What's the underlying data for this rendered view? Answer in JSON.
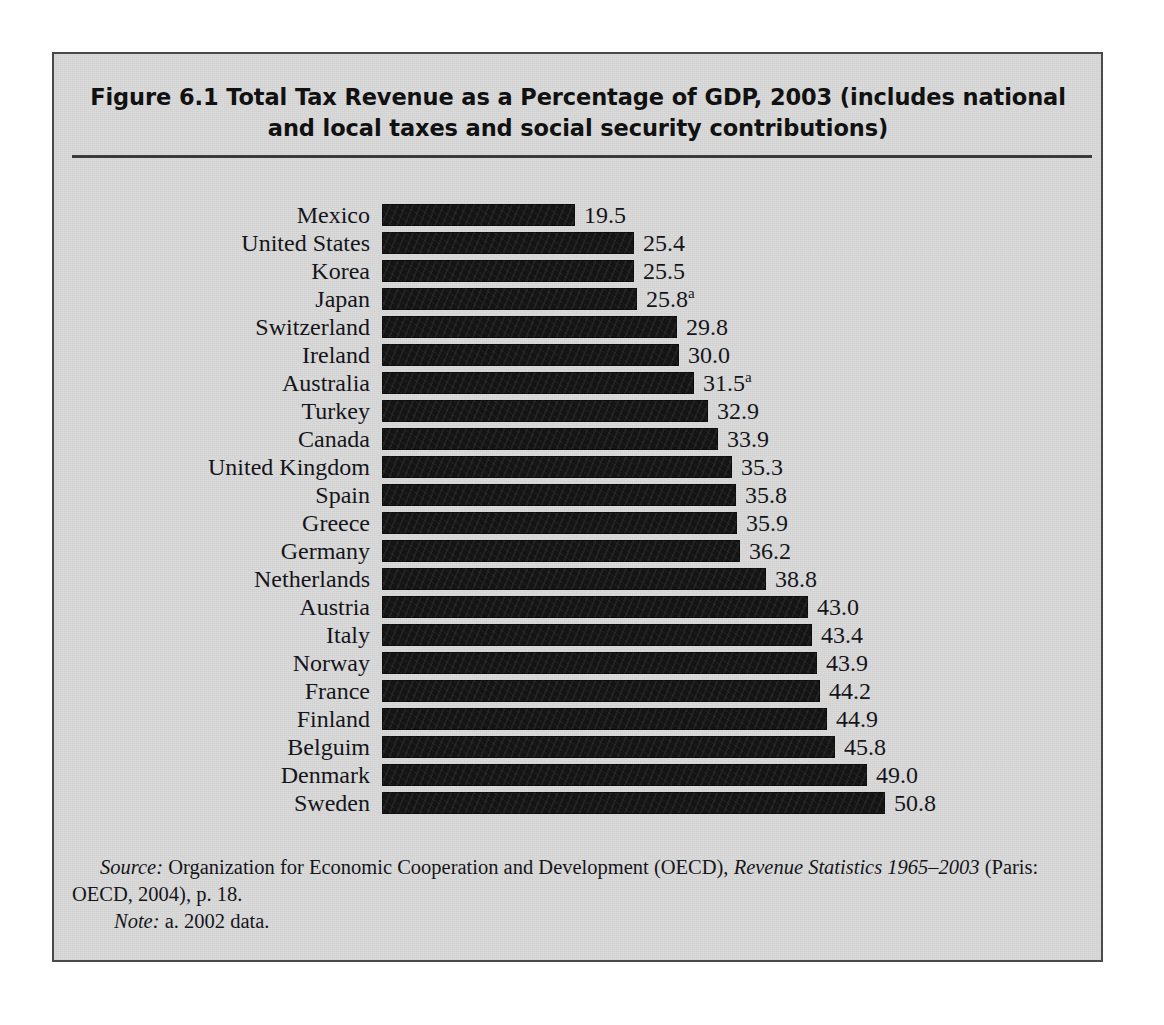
{
  "figure": {
    "title_line1": "Figure 6.1  Total Tax Revenue as a Percentage of GDP, 2003 (includes national",
    "title_line2": "and local taxes and social security contributions)",
    "source_label": "Source:",
    "source_text_1": " Organization for Economic Cooperation and Development (OECD), ",
    "source_title_italic": "Revenue Statistics 1965–2003",
    "source_text_2": " (Paris: OECD, 2004), p. 18.",
    "note_label": "Note:",
    "note_text": " a. 2002 data."
  },
  "colors": {
    "page_background": "#ffffff",
    "figure_background": "#d9d9d9",
    "frame_border": "#4a4a4a",
    "bar_fill": "#141414",
    "text": "#15151a",
    "rule": "#3a3a3a"
  },
  "chart_data": {
    "type": "bar",
    "orientation": "horizontal",
    "title": "Figure 6.1  Total Tax Revenue as a Percentage of GDP, 2003 (includes national and local taxes and social security contributions)",
    "xlabel": "",
    "ylabel": "",
    "xlim": [
      0,
      50.8
    ],
    "grid": false,
    "legend": false,
    "units": "percent of GDP",
    "categories": [
      "Mexico",
      "United States",
      "Korea",
      "Japan",
      "Switzerland",
      "Ireland",
      "Australia",
      "Turkey",
      "Canada",
      "United Kingdom",
      "Spain",
      "Greece",
      "Germany",
      "Netherlands",
      "Austria",
      "Italy",
      "Norway",
      "France",
      "Finland",
      "Belguim",
      "Denmark",
      "Sweden"
    ],
    "values": [
      19.5,
      25.4,
      25.5,
      25.8,
      29.8,
      30.0,
      31.5,
      32.9,
      33.9,
      35.3,
      35.8,
      35.9,
      36.2,
      38.8,
      43.0,
      43.4,
      43.9,
      44.2,
      44.9,
      45.8,
      49.0,
      50.8
    ],
    "data_labels": [
      "19.5",
      "25.4",
      "25.5",
      "25.8",
      "29.8",
      "30.0",
      "31.5",
      "32.9",
      "33.9",
      "35.3",
      "35.8",
      "35.9",
      "36.2",
      "38.8",
      "43.0",
      "43.4",
      "43.9",
      "44.2",
      "44.9",
      "45.8",
      "49.0",
      "50.8"
    ],
    "footnote_markers": [
      "",
      "",
      "",
      "a",
      "",
      "",
      "a",
      "",
      "",
      "",
      "",
      "",
      "",
      "",
      "",
      "",
      "",
      "",
      "",
      "",
      "",
      ""
    ],
    "annotations": [
      "a. 2002 data."
    ]
  }
}
